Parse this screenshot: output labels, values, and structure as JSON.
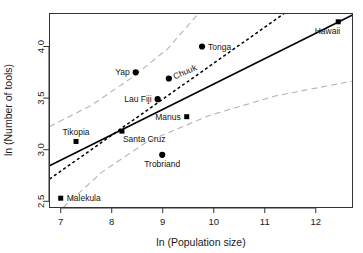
{
  "chart_data": {
    "type": "scatter",
    "title": "",
    "xlabel": "ln (Population size)",
    "ylabel": "ln (Number of tools)",
    "xlim": [
      6.78,
      12.72
    ],
    "ylim": [
      2.44,
      4.32
    ],
    "xticks": [
      "7",
      "8",
      "9",
      "10",
      "11",
      "12"
    ],
    "xtick_values": [
      7,
      8,
      9,
      10,
      11,
      12
    ],
    "yticks": [
      "2.5",
      "3.0",
      "3.5",
      "4.0"
    ],
    "ytick_values": [
      2.5,
      3.0,
      3.5,
      4.0
    ],
    "grid": false,
    "legend": "none",
    "points": [
      {
        "label": "Malekula",
        "x": 7.0,
        "y": 2.53,
        "marker": "square",
        "label_pos": "right"
      },
      {
        "label": "Tikopia",
        "x": 7.3,
        "y": 3.08,
        "marker": "square",
        "label_pos": "above"
      },
      {
        "label": "Santa Cruz",
        "x": 8.2,
        "y": 3.18,
        "marker": "square",
        "label_pos": "below-right"
      },
      {
        "label": "Yap",
        "x": 8.47,
        "y": 3.75,
        "marker": "circle",
        "label_pos": "left"
      },
      {
        "label": "Lau Fiji",
        "x": 8.9,
        "y": 3.49,
        "marker": "circle",
        "label_pos": "left"
      },
      {
        "label": "Trobriand",
        "x": 8.99,
        "y": 2.95,
        "marker": "circle",
        "label_pos": "below"
      },
      {
        "label": "Chuuk",
        "x": 9.12,
        "y": 3.69,
        "marker": "circle",
        "label_pos": "right-rotated"
      },
      {
        "label": "Manus",
        "x": 9.47,
        "y": 3.32,
        "marker": "square",
        "label_pos": "left"
      },
      {
        "label": "Tonga",
        "x": 9.77,
        "y": 4.0,
        "marker": "circle",
        "label_pos": "right"
      },
      {
        "label": "Hawaii",
        "x": 12.44,
        "y": 4.24,
        "marker": "square",
        "label_pos": "below-left"
      }
    ],
    "lines": [
      {
        "name": "solid-regression",
        "style": "solid",
        "color": "#000000",
        "points": [
          [
            6.78,
            2.845
          ],
          [
            12.72,
            4.305
          ]
        ]
      },
      {
        "name": "dashed-regression",
        "style": "dashed",
        "color": "#000000",
        "points": [
          [
            6.78,
            2.715
          ],
          [
            11.38,
            4.32
          ]
        ]
      },
      {
        "name": "upper-confidence-band",
        "style": "dashed",
        "color": "#b4b4b4",
        "points": [
          [
            6.78,
            3.225
          ],
          [
            7.6,
            3.43
          ],
          [
            8.4,
            3.7
          ],
          [
            9.1,
            3.98
          ],
          [
            9.7,
            4.32
          ]
        ]
      },
      {
        "name": "lower-confidence-band",
        "style": "dashed",
        "color": "#b4b4b4",
        "points": [
          [
            7.05,
            2.44
          ],
          [
            7.8,
            2.78
          ],
          [
            8.7,
            3.08
          ],
          [
            9.9,
            3.33
          ],
          [
            11.2,
            3.52
          ],
          [
            12.72,
            3.665
          ]
        ]
      }
    ],
    "markers": {
      "circle_color": "#000000",
      "square_color": "#000000"
    }
  },
  "axis": {
    "x_title": "ln (Population size)",
    "y_title": "ln (Number of tools)"
  }
}
